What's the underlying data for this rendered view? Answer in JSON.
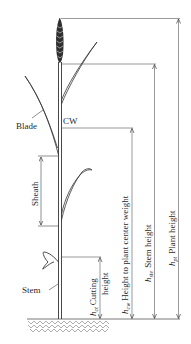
{
  "diagram": {
    "labels": {
      "blade": "Blade",
      "cw": "CW",
      "sheath": "Sheath",
      "stem": "Stem"
    },
    "dimensions": [
      {
        "symbol": "h",
        "subscript": "ct",
        "text": "Cutting",
        "text2": "height"
      },
      {
        "symbol": "h",
        "subscript": "cw",
        "text": "Height to plant center weight"
      },
      {
        "symbol": "h",
        "subscript": "ste",
        "text": "Stem height"
      },
      {
        "symbol": "h",
        "subscript": "pt",
        "text": "Plant height"
      }
    ],
    "colors": {
      "line": "#444444",
      "plant": "#333333",
      "background": "#ffffff"
    }
  }
}
